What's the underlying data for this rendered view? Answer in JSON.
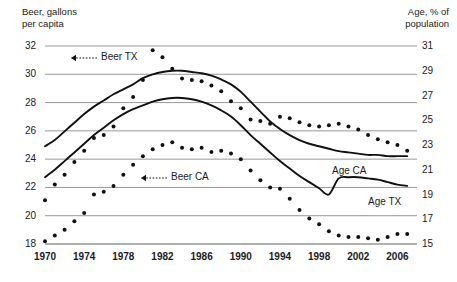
{
  "chart_data": {
    "type": "line",
    "title": "",
    "left_axis": {
      "label": "Beer, gallons\nper capita",
      "ticks": [
        18,
        20,
        22,
        24,
        26,
        28,
        30,
        32
      ],
      "range": [
        18,
        32
      ]
    },
    "right_axis": {
      "label": "Age, % of\npopulation",
      "ticks": [
        15,
        17,
        19,
        21,
        23,
        25,
        27,
        29,
        31
      ],
      "range": [
        15,
        31
      ]
    },
    "x": {
      "label": "",
      "tick_labels": [
        "1970",
        "1974",
        "1978",
        "1982",
        "1986",
        "1990",
        "1994",
        "1998",
        "2002",
        "2006"
      ],
      "tick_values": [
        1970,
        1974,
        1978,
        1982,
        1986,
        1990,
        1994,
        1998,
        2002,
        2006
      ],
      "range": [
        1970,
        2008
      ],
      "years": [
        1970,
        1971,
        1972,
        1973,
        1974,
        1975,
        1976,
        1977,
        1978,
        1979,
        1980,
        1981,
        1982,
        1983,
        1984,
        1985,
        1986,
        1987,
        1988,
        1989,
        1990,
        1991,
        1992,
        1993,
        1994,
        1995,
        1996,
        1997,
        1998,
        1999,
        2000,
        2001,
        2002,
        2003,
        2004,
        2005,
        2006,
        2007
      ]
    },
    "grid": true,
    "legend_position": "inline-annotations",
    "series": [
      {
        "name": "Beer TX",
        "axis": "left",
        "style": "dotted",
        "color": "#111111",
        "values": [
          21.1,
          22.2,
          22.9,
          23.8,
          24.6,
          25.5,
          25.7,
          26.3,
          27.6,
          28.4,
          29.6,
          31.7,
          31.2,
          30.4,
          29.7,
          29.6,
          29.5,
          29.2,
          28.8,
          28.1,
          27.6,
          26.8,
          26.7,
          26.5,
          27.0,
          26.9,
          26.6,
          26.4,
          26.3,
          26.4,
          26.5,
          26.3,
          26.1,
          25.7,
          25.4,
          25.2,
          25.0,
          24.6
        ]
      },
      {
        "name": "Beer CA",
        "axis": "left",
        "style": "dotted",
        "color": "#111111",
        "values": [
          18.2,
          18.6,
          19.0,
          19.6,
          20.2,
          21.5,
          21.7,
          22.1,
          22.9,
          23.6,
          24.2,
          24.7,
          25.0,
          25.2,
          24.8,
          24.7,
          24.8,
          24.5,
          24.6,
          24.4,
          24.0,
          23.2,
          22.5,
          22.0,
          21.9,
          21.2,
          20.4,
          19.8,
          19.4,
          18.9,
          18.6,
          18.5,
          18.5,
          18.4,
          18.3,
          18.5,
          18.7,
          18.7
        ]
      },
      {
        "name": "Age CA",
        "axis": "right",
        "style": "solid",
        "color": "#111111",
        "values": [
          22.9,
          23.4,
          24.1,
          24.8,
          25.5,
          26.1,
          26.6,
          27.1,
          27.5,
          27.9,
          28.4,
          28.7,
          28.9,
          29.0,
          29.0,
          28.9,
          28.8,
          28.6,
          28.3,
          27.9,
          27.3,
          26.5,
          25.7,
          24.9,
          24.3,
          23.8,
          23.4,
          23.1,
          22.9,
          22.7,
          22.5,
          22.4,
          22.3,
          22.2,
          22.2,
          22.1,
          22.1,
          22.1
        ]
      },
      {
        "name": "Age TX",
        "axis": "right",
        "style": "solid",
        "color": "#111111",
        "values": [
          20.4,
          21.0,
          21.7,
          22.4,
          23.1,
          23.8,
          24.4,
          25.0,
          25.5,
          25.9,
          26.2,
          26.5,
          26.7,
          26.8,
          26.8,
          26.7,
          26.5,
          26.2,
          25.8,
          25.3,
          24.6,
          23.8,
          23.1,
          22.4,
          21.7,
          21.1,
          20.5,
          20.0,
          19.5,
          19.0,
          20.3,
          20.4,
          20.4,
          20.3,
          20.2,
          20.0,
          19.8,
          19.7
        ]
      }
    ],
    "annotations": [
      {
        "name": "Beer TX",
        "text": "Beer TX",
        "arrow": "left-dashed"
      },
      {
        "name": "Beer CA",
        "text": "Beer CA",
        "arrow": "left-dashed"
      },
      {
        "name": "Age CA",
        "text": "Age CA",
        "arrow": "none"
      },
      {
        "name": "Age TX",
        "text": "Age TX",
        "arrow": "none"
      }
    ]
  },
  "labels": {
    "left_axis_title": "Beer, gallons\nper capita",
    "right_axis_title": "Age, % of\npopulation",
    "y_left": [
      "32",
      "30",
      "28",
      "26",
      "24",
      "22",
      "20",
      "18"
    ],
    "y_right": [
      "31",
      "29",
      "27",
      "25",
      "23",
      "21",
      "19",
      "17",
      "15"
    ],
    "x_ticks": [
      "1970",
      "1974",
      "1978",
      "1982",
      "1986",
      "1990",
      "1994",
      "1998",
      "2002",
      "2006"
    ],
    "ann_beer_tx": "Beer TX",
    "ann_beer_ca": "Beer CA",
    "ann_age_ca": "Age CA",
    "ann_age_tx": "Age TX"
  },
  "colors": {
    "line": "#111111",
    "grid": "#8c8c8c",
    "text": "#1a1a1a",
    "background": "#ffffff"
  }
}
